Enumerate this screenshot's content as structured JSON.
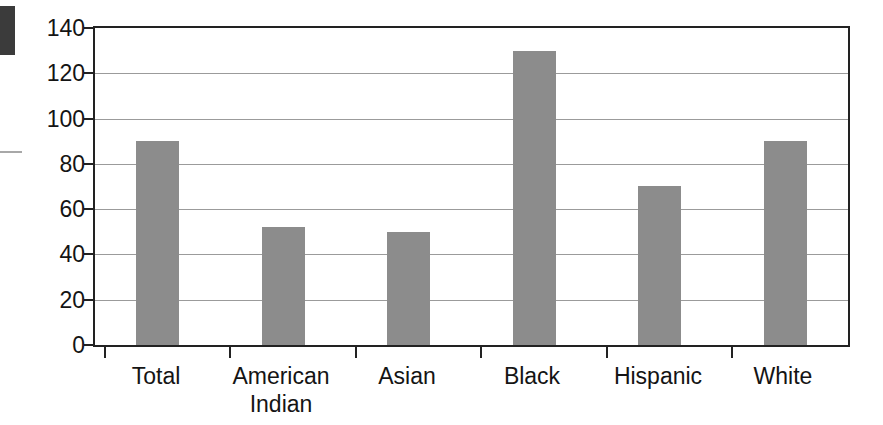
{
  "chart_data": {
    "type": "bar",
    "title": "",
    "subtitle": "",
    "xlabel": "",
    "ylabel": "",
    "categories": [
      "Total",
      "American Indian",
      "Asian",
      "Black",
      "Hispanic",
      "White"
    ],
    "category_labels_multiline": [
      "Total",
      "American\nIndian",
      "Asian",
      "Black",
      "Hispanic",
      "White"
    ],
    "values": [
      90,
      52,
      50,
      130,
      70,
      90
    ],
    "series": [
      {
        "name": "Rate",
        "values": [
          90,
          52,
          50,
          130,
          70,
          90
        ]
      }
    ],
    "ylim": [
      0,
      140
    ],
    "ytick_values": [
      0,
      20,
      40,
      60,
      80,
      100,
      120,
      140
    ],
    "ytick_labels": [
      "0",
      "20",
      "40",
      "60",
      "80",
      "100",
      "120",
      "140"
    ],
    "grid": true,
    "grid_axis": "y",
    "legend": false,
    "legend_position": "none",
    "bar_color": "#8c8c8c",
    "axis_color": "#222222",
    "gridline_color": "#9b9b9b",
    "background_color": "#ffffff",
    "annotations": []
  },
  "artifacts": {
    "corner_block_color": "#3b3b3b",
    "margin_rule_color": "#a8a8a8"
  }
}
